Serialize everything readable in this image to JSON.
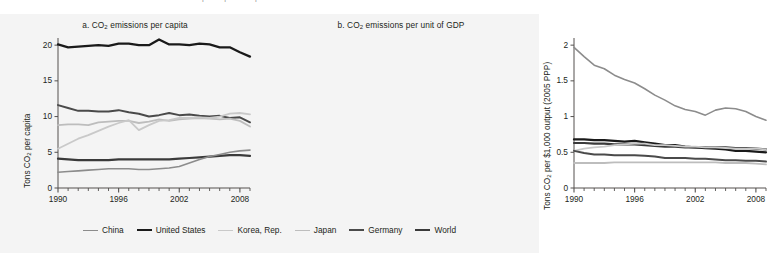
{
  "figure": {
    "background": "#f4f4f4",
    "cut_text": "CO   emissions per capita and per unit of GDP"
  },
  "legend": {
    "position": "bottom-center",
    "items": [
      {
        "label": "China",
        "color": "#8c8c8c",
        "width": 1.6
      },
      {
        "label": "United States",
        "color": "#1a1a1a",
        "width": 2.3
      },
      {
        "label": "Korea, Rep.",
        "color": "#c9c9c9",
        "width": 1.8
      },
      {
        "label": "Japan",
        "color": "#bdbdbd",
        "width": 1.8
      },
      {
        "label": "Germany",
        "color": "#4a4a4a",
        "width": 2.0
      },
      {
        "label": "World",
        "color": "#3a3a3a",
        "width": 2.2
      }
    ]
  },
  "chart_data": [
    {
      "type": "line",
      "title": "a. CO2 emissions per capita",
      "title_prefix": "a. CO",
      "title_sub": "2",
      "title_suffix": " emissions per capita",
      "xlabel": "",
      "ylabel": "Tons CO2 per capita",
      "ylabel_prefix": "Tons CO",
      "ylabel_sub": "2",
      "ylabel_suffix": " per capita",
      "xlim": [
        1990,
        2009
      ],
      "ylim": [
        0,
        21
      ],
      "yticks": [
        0,
        5,
        10,
        15,
        20
      ],
      "ytick_labels": [
        "0",
        "5",
        "10",
        "15",
        "20"
      ],
      "xticks": [
        1990,
        1991,
        1992,
        1993,
        1994,
        1995,
        1996,
        1997,
        1998,
        1999,
        2000,
        2001,
        2002,
        2003,
        2004,
        2005,
        2006,
        2007,
        2008,
        2009
      ],
      "xtick_labels": [
        "1990",
        "1996",
        "2002",
        "2008"
      ],
      "xtick_label_years": [
        1990,
        1996,
        2002,
        2008
      ],
      "grid": false,
      "x": [
        1990,
        1991,
        1992,
        1993,
        1994,
        1995,
        1996,
        1997,
        1998,
        1999,
        2000,
        2001,
        2002,
        2003,
        2004,
        2005,
        2006,
        2007,
        2008,
        2009
      ],
      "series": [
        {
          "name": "United States",
          "color": "#1a1a1a",
          "width": 2.3,
          "values": [
            20.1,
            19.7,
            19.8,
            19.9,
            20.0,
            19.9,
            20.2,
            20.2,
            20.0,
            20.0,
            20.8,
            20.1,
            20.1,
            20.0,
            20.2,
            20.1,
            19.7,
            19.7,
            19.0,
            18.4
          ]
        },
        {
          "name": "Germany",
          "color": "#4a4a4a",
          "width": 2.0,
          "values": [
            11.6,
            11.2,
            10.8,
            10.8,
            10.7,
            10.7,
            10.9,
            10.6,
            10.4,
            10.0,
            10.2,
            10.5,
            10.2,
            10.3,
            10.1,
            10.0,
            10.1,
            9.8,
            9.9,
            9.2
          ]
        },
        {
          "name": "Japan",
          "color": "#bdbdbd",
          "width": 1.8,
          "values": [
            8.8,
            8.9,
            8.9,
            8.8,
            9.2,
            9.3,
            9.4,
            9.4,
            9.1,
            9.3,
            9.6,
            9.4,
            9.6,
            9.7,
            9.8,
            9.7,
            9.6,
            9.7,
            9.4,
            8.6
          ]
        },
        {
          "name": "Korea, Rep.",
          "color": "#c9c9c9",
          "width": 1.8,
          "values": [
            5.5,
            6.2,
            6.9,
            7.4,
            8.0,
            8.6,
            9.1,
            9.5,
            8.1,
            8.8,
            9.4,
            9.5,
            9.8,
            9.8,
            9.9,
            9.8,
            10.0,
            10.4,
            10.5,
            10.3
          ]
        },
        {
          "name": "World",
          "color": "#3a3a3a",
          "width": 2.2,
          "values": [
            4.1,
            4.0,
            3.9,
            3.9,
            3.9,
            3.9,
            4.0,
            4.0,
            4.0,
            4.0,
            4.0,
            4.0,
            4.1,
            4.2,
            4.3,
            4.4,
            4.5,
            4.6,
            4.6,
            4.5
          ]
        },
        {
          "name": "China",
          "color": "#8c8c8c",
          "width": 1.6,
          "values": [
            2.2,
            2.3,
            2.4,
            2.5,
            2.6,
            2.7,
            2.7,
            2.7,
            2.6,
            2.6,
            2.7,
            2.8,
            3.0,
            3.5,
            4.0,
            4.4,
            4.7,
            5.0,
            5.2,
            5.3
          ]
        }
      ]
    },
    {
      "type": "line",
      "title": "b. CO2 emissions per unit of GDP",
      "title_prefix": "b. CO",
      "title_sub": "2",
      "title_suffix": " emissions per unit of GDP",
      "xlabel": "",
      "ylabel": "Tons CO2 per $1,000 output (2005 PPP)",
      "ylabel_prefix": "Tons CO",
      "ylabel_sub": "2",
      "ylabel_suffix": " per $1,000 output (2005 PPP)",
      "xlim": [
        1990,
        2009
      ],
      "ylim": [
        0,
        2.1
      ],
      "yticks": [
        0,
        0.5,
        1,
        1.5,
        2
      ],
      "ytick_labels": [
        "0",
        "0.5",
        "1",
        "1.5",
        "2"
      ],
      "xticks": [
        1990,
        1991,
        1992,
        1993,
        1994,
        1995,
        1996,
        1997,
        1998,
        1999,
        2000,
        2001,
        2002,
        2003,
        2004,
        2005,
        2006,
        2007,
        2008,
        2009
      ],
      "xtick_labels": [
        "1990",
        "1996",
        "2002",
        "2008"
      ],
      "xtick_label_years": [
        1990,
        1996,
        2002,
        2008
      ],
      "grid": false,
      "x": [
        1990,
        1991,
        1992,
        1993,
        1994,
        1995,
        1996,
        1997,
        1998,
        1999,
        2000,
        2001,
        2002,
        2003,
        2004,
        2005,
        2006,
        2007,
        2008,
        2009
      ],
      "series": [
        {
          "name": "China",
          "color": "#8c8c8c",
          "width": 1.6,
          "values": [
            1.97,
            1.84,
            1.72,
            1.67,
            1.58,
            1.52,
            1.47,
            1.39,
            1.3,
            1.23,
            1.15,
            1.1,
            1.07,
            1.02,
            1.09,
            1.12,
            1.11,
            1.07,
            1.0,
            0.95
          ]
        },
        {
          "name": "United States",
          "color": "#1a1a1a",
          "width": 2.3,
          "values": [
            0.68,
            0.68,
            0.67,
            0.67,
            0.66,
            0.65,
            0.66,
            0.64,
            0.62,
            0.6,
            0.6,
            0.58,
            0.57,
            0.56,
            0.55,
            0.54,
            0.52,
            0.52,
            0.51,
            0.5
          ]
        },
        {
          "name": "World",
          "color": "#3a3a3a",
          "width": 2.2,
          "values": [
            0.63,
            0.63,
            0.62,
            0.62,
            0.61,
            0.61,
            0.61,
            0.6,
            0.59,
            0.58,
            0.58,
            0.57,
            0.57,
            0.57,
            0.57,
            0.57,
            0.56,
            0.56,
            0.55,
            0.54
          ]
        },
        {
          "name": "Korea, Rep.",
          "color": "#c9c9c9",
          "width": 1.8,
          "values": [
            0.52,
            0.55,
            0.57,
            0.58,
            0.6,
            0.61,
            0.62,
            0.62,
            0.6,
            0.6,
            0.59,
            0.58,
            0.58,
            0.57,
            0.57,
            0.56,
            0.55,
            0.55,
            0.55,
            0.54
          ]
        },
        {
          "name": "Germany",
          "color": "#4a4a4a",
          "width": 2.0,
          "values": [
            0.52,
            0.49,
            0.47,
            0.47,
            0.46,
            0.46,
            0.46,
            0.45,
            0.44,
            0.42,
            0.42,
            0.42,
            0.41,
            0.41,
            0.4,
            0.39,
            0.39,
            0.38,
            0.38,
            0.37
          ]
        },
        {
          "name": "Japan",
          "color": "#bdbdbd",
          "width": 1.8,
          "values": [
            0.35,
            0.35,
            0.35,
            0.35,
            0.36,
            0.36,
            0.36,
            0.36,
            0.36,
            0.36,
            0.36,
            0.36,
            0.36,
            0.36,
            0.36,
            0.35,
            0.35,
            0.35,
            0.34,
            0.33
          ]
        }
      ]
    }
  ]
}
